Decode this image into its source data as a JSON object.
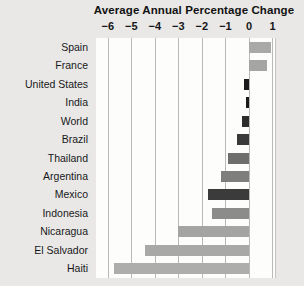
{
  "chart_data": {
    "type": "bar",
    "orientation": "horizontal",
    "title": "Average Annual Percentage Change",
    "xlabel": "",
    "ylabel": "",
    "xlim": [
      -6.5,
      1.15
    ],
    "grid": true,
    "legend": "none",
    "xticks": [
      -6,
      -5,
      -4,
      -3,
      -2,
      -1,
      0,
      1
    ],
    "xtick_labels": [
      "−6",
      "−5",
      "−4",
      "−3",
      "−2",
      "−1",
      "0",
      "1"
    ],
    "categories": [
      "Spain",
      "France",
      "United States",
      "India",
      "World",
      "Brazil",
      "Thailand",
      "Argentina",
      "Mexico",
      "Indonesia",
      "Nicaragua",
      "El Salvador",
      "Haiti"
    ],
    "values": [
      0.95,
      0.75,
      -0.2,
      -0.12,
      -0.3,
      -0.5,
      -0.9,
      -1.2,
      -1.75,
      -1.55,
      -3.0,
      -4.4,
      -5.75
    ],
    "bar_colors": [
      "#a9a9a7",
      "#a5a5a3",
      "#1c1c1c",
      "#1a1a1a",
      "#2c2c2c",
      "#3a3a3a",
      "#6e6e6c",
      "#7e7e7c",
      "#3b3b3b",
      "#8c8c8a",
      "#a4a4a2",
      "#a8a8a6",
      "#adadab"
    ]
  },
  "theme": {
    "page_background": "#e9e8e6",
    "plot_background": "#fdfdfc",
    "gridline_color": "#b9b9b7",
    "text_color": "#18181b",
    "title_color": "#121212"
  }
}
